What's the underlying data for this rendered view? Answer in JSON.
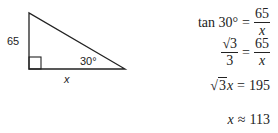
{
  "diagram": {
    "type": "right-triangle",
    "vertices": {
      "top": [
        29,
        13
      ],
      "right_angle": [
        29,
        69
      ],
      "acute": [
        125,
        69
      ]
    },
    "labels": {
      "vertical_side": "65",
      "horizontal_side": "x",
      "angle": "30°"
    }
  },
  "equations": [
    {
      "lhs": "tan 30°",
      "op": "=",
      "rhs_num": "65",
      "rhs_den": "x"
    },
    {
      "lhs_num": "√3",
      "lhs_den": "3",
      "op": "=",
      "rhs_num": "65",
      "rhs_den": "x"
    },
    {
      "lhs_rad": "3",
      "lhs_var": "x",
      "op": "=",
      "rhs": "195"
    },
    {
      "lhs": "x",
      "op": "≈",
      "rhs": "113"
    }
  ]
}
